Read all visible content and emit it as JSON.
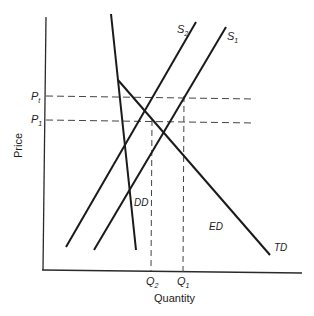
{
  "diagram": {
    "type": "supply-demand",
    "axis": {
      "x_label": "Quantity",
      "y_label": "Price"
    },
    "price_levels": [
      {
        "id": "Pt",
        "main": "P",
        "sub": "t"
      },
      {
        "id": "P1",
        "main": "P",
        "sub": "1"
      }
    ],
    "quantity_levels": [
      {
        "id": "Q2",
        "main": "Q",
        "sub": "2"
      },
      {
        "id": "Q1",
        "main": "Q",
        "sub": "1"
      }
    ],
    "curves": [
      {
        "id": "S2",
        "main": "S",
        "sub": "2",
        "kind": "supply"
      },
      {
        "id": "S1",
        "main": "S",
        "sub": "1",
        "kind": "supply"
      },
      {
        "id": "DD",
        "label": "DD",
        "kind": "domestic-demand"
      },
      {
        "id": "TD",
        "label": "TD",
        "kind": "total-demand"
      }
    ],
    "region_labels": [
      {
        "id": "ED",
        "label": "ED"
      }
    ],
    "colors": {
      "line": "#1a1a1a",
      "dashed": "#444444",
      "text": "#222222"
    }
  }
}
